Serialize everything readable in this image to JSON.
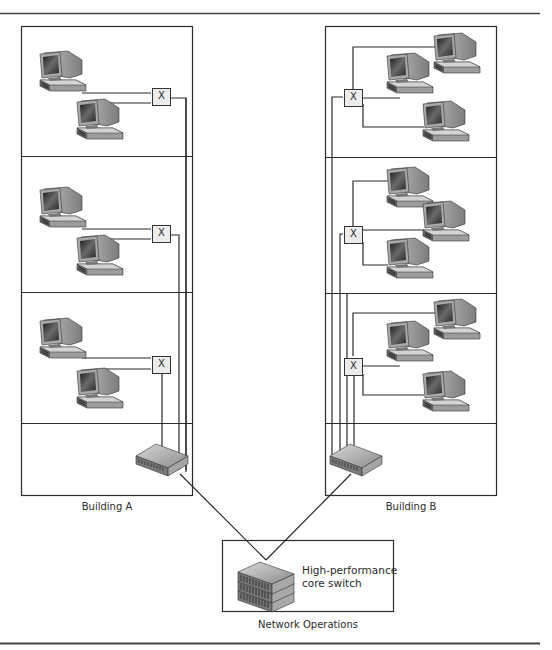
{
  "diagram": {
    "type": "network-topology",
    "buildings": [
      {
        "id": "building-a",
        "label": "Building A",
        "floors": [
          {
            "workstations": 2,
            "hub_label": "X"
          },
          {
            "workstations": 2,
            "hub_label": "X"
          },
          {
            "workstations": 2,
            "hub_label": "X"
          }
        ],
        "switch": "building-switch"
      },
      {
        "id": "building-b",
        "label": "Building B",
        "floors": [
          {
            "workstations": 3,
            "hub_label": "X"
          },
          {
            "workstations": 3,
            "hub_label": "X"
          },
          {
            "workstations": 3,
            "hub_label": "X"
          }
        ],
        "switch": "building-switch"
      }
    ],
    "core": {
      "label_line1": "High-performance",
      "label_line2": "core switch",
      "location_label": "Network Operations"
    },
    "links": [
      {
        "from": "building-a-switch",
        "to": "core-switch"
      },
      {
        "from": "building-b-switch",
        "to": "core-switch"
      }
    ],
    "colors": {
      "line": "#2b2b2b",
      "hub_fill": "#ececec",
      "monitor_body": "#9a9a9a",
      "screen": "#3a3a3a"
    }
  }
}
